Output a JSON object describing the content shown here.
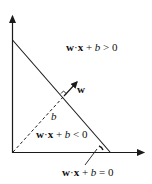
{
  "diagram": {
    "title": "",
    "labels": {
      "positive_region": {
        "w": "w",
        "dot": "·",
        "x": "x",
        "plus": " + ",
        "b": "b",
        "rel": " > 0"
      },
      "negative_region": {
        "w": "w",
        "dot": "·",
        "x": "x",
        "plus": " + ",
        "b": "b",
        "rel": " < 0"
      },
      "boundary": {
        "w": "w",
        "dot": "·",
        "x": "x",
        "plus": " + ",
        "b": "b",
        "rel": " = 0"
      },
      "weight_vector": "w",
      "bias_distance": "b"
    },
    "colors": {
      "stroke": "#1a1a1a",
      "background": "#ffffff"
    }
  }
}
